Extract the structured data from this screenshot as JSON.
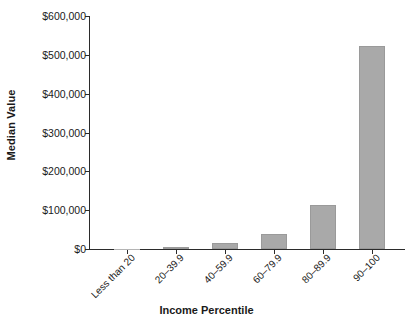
{
  "chart_data": {
    "type": "bar",
    "title": "",
    "xlabel": "Income Percentile",
    "ylabel": "Median Value",
    "categories": [
      "Less than 20",
      "20–39.9",
      "40–59.9",
      "60–79.9",
      "80–89.9",
      "90–100"
    ],
    "values": [
      0,
      3000,
      15000,
      39000,
      113000,
      523000
    ],
    "ylim": [
      0,
      600000
    ],
    "ytick_values": [
      0,
      100000,
      200000,
      300000,
      400000,
      500000,
      600000
    ],
    "ytick_labels": [
      "$0",
      "$100,000",
      "$200,000",
      "$300,000",
      "$400,000",
      "$500,000",
      "$600,000"
    ],
    "grid": false,
    "legend": false,
    "bar_color": "#a9a9a9",
    "axis_color": "#2b2b2b",
    "text_color": "#1a1a1a"
  }
}
